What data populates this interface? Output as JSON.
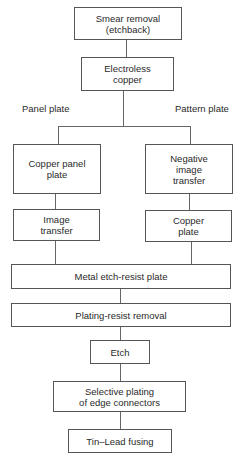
{
  "diagram": {
    "type": "flowchart",
    "nodes": {
      "smear_removal": "Smear removal\n(etchback)",
      "electroless_copper": "Electroless\ncopper",
      "copper_panel_plate": "Copper panel\nplate",
      "negative_image_transfer": "Negative\nimage\ntransfer",
      "image_transfer": "Image\ntransfer",
      "copper_plate": "Copper\nplate",
      "metal_etch_resist_plate": "Metal etch-resist plate",
      "plating_resist_removal": "Plating-resist removal",
      "etch": "Etch",
      "selective_plating": "Selective plating\nof edge connectors",
      "tin_lead_fusing": "Tin–Lead fusing"
    },
    "branch_labels": {
      "left": "Panel plate",
      "right": "Pattern plate"
    },
    "edges": [
      [
        "smear_removal",
        "electroless_copper"
      ],
      [
        "electroless_copper",
        "copper_panel_plate"
      ],
      [
        "electroless_copper",
        "negative_image_transfer"
      ],
      [
        "copper_panel_plate",
        "image_transfer"
      ],
      [
        "negative_image_transfer",
        "copper_plate"
      ],
      [
        "image_transfer",
        "metal_etch_resist_plate"
      ],
      [
        "copper_plate",
        "metal_etch_resist_plate"
      ],
      [
        "metal_etch_resist_plate",
        "plating_resist_removal"
      ],
      [
        "plating_resist_removal",
        "etch"
      ],
      [
        "etch",
        "selective_plating"
      ],
      [
        "selective_plating",
        "tin_lead_fusing"
      ]
    ]
  }
}
